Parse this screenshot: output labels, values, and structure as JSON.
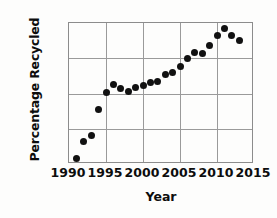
{
  "chart_data": {
    "type": "scatter",
    "title": "",
    "xlabel": "Year",
    "ylabel": "Percentage Recycled",
    "xlim": [
      1990,
      2015
    ],
    "ylim": [
      15,
      27
    ],
    "grid": true,
    "legend": false,
    "xticks": [
      "1990",
      "1995",
      "2000",
      "2005",
      "2010",
      "2015"
    ],
    "xtick_values": [
      1990,
      1995,
      2000,
      2005,
      2010,
      2015
    ],
    "yticks": [
      "15%",
      "18%",
      "21%",
      "24%",
      "27%"
    ],
    "ytick_values": [
      15,
      18,
      21,
      24,
      27
    ],
    "x": [
      1991,
      1992,
      1993,
      1994,
      1995,
      1996,
      1997,
      1998,
      1999,
      2000,
      2001,
      2002,
      2003,
      2004,
      2005,
      2006,
      2007,
      2008,
      2009,
      2010,
      2011,
      2012,
      2013
    ],
    "values": [
      15.5,
      16.9,
      17.4,
      19.6,
      21.1,
      21.8,
      21.4,
      21.2,
      21.5,
      21.7,
      21.9,
      22.0,
      22.6,
      22.8,
      23.3,
      24.0,
      24.5,
      24.4,
      25.1,
      25.9,
      26.5,
      25.9,
      25.5
    ],
    "marker": "filled-circle",
    "marker_color": "#111111",
    "grid_color": "#9a9a9a",
    "background_color": "#ffffff"
  }
}
